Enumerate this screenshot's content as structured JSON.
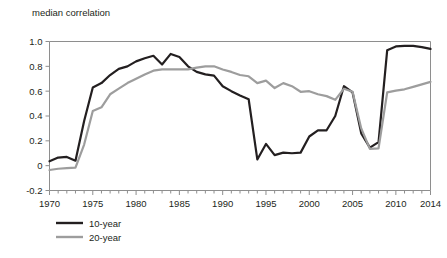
{
  "chart_data": {
    "type": "line",
    "title": "median correlation",
    "xlabel": "",
    "ylabel": "median correlation",
    "xlim": [
      1970,
      2014
    ],
    "ylim": [
      -0.2,
      1.0
    ],
    "grid": false,
    "legend_position": "bottom-left",
    "y_ticks": [
      "1.0",
      "0.8",
      "0.6",
      "0.4",
      "0.2",
      "0",
      "-0.2"
    ],
    "y_tick_values": [
      1.0,
      0.8,
      0.6,
      0.4,
      0.2,
      0,
      -0.2
    ],
    "x_ticks": [
      "1970",
      "1975",
      "1980",
      "1985",
      "1990",
      "1995",
      "2000",
      "2005",
      "2010",
      "2014"
    ],
    "x_tick_values": [
      1970,
      1975,
      1980,
      1985,
      1990,
      1995,
      2000,
      2005,
      2010,
      2014
    ],
    "x_minor_tick_step": 1,
    "x": [
      1970,
      1971,
      1972,
      1973,
      1974,
      1975,
      1976,
      1977,
      1978,
      1979,
      1980,
      1981,
      1982,
      1983,
      1984,
      1985,
      1986,
      1987,
      1988,
      1989,
      1990,
      1991,
      1992,
      1993,
      1994,
      1995,
      1996,
      1997,
      1998,
      1999,
      2000,
      2001,
      2002,
      2003,
      2004,
      2005,
      2006,
      2007,
      2008,
      2009,
      2010,
      2011,
      2012,
      2013,
      2014
    ],
    "series": [
      {
        "name": "10-year",
        "color": "#231f20",
        "width": 2.2,
        "values": [
          0.035,
          0.065,
          0.07,
          0.04,
          0.36,
          0.63,
          0.665,
          0.73,
          0.78,
          0.8,
          0.84,
          0.865,
          0.885,
          0.815,
          0.9,
          0.875,
          0.8,
          0.755,
          0.735,
          0.725,
          0.64,
          0.6,
          0.565,
          0.535,
          0.05,
          0.175,
          0.085,
          0.105,
          0.1,
          0.105,
          0.235,
          0.285,
          0.285,
          0.4,
          0.64,
          0.59,
          0.26,
          0.145,
          0.19,
          0.155,
          0.135,
          0.13,
          0.13,
          0.93,
          0.945
        ]
      },
      {
        "name": "20-year",
        "color": "#9d9d9d",
        "width": 2.2,
        "values": [
          -0.035,
          -0.025,
          -0.02,
          -0.015,
          0.17,
          0.44,
          0.47,
          0.575,
          0.62,
          0.665,
          0.7,
          0.735,
          0.765,
          0.775,
          0.775,
          0.775,
          0.775,
          0.79,
          0.8,
          0.8,
          0.775,
          0.755,
          0.73,
          0.72,
          0.665,
          0.685,
          0.625,
          0.665,
          0.64,
          0.595,
          0.6,
          0.575,
          0.56,
          0.53,
          0.62,
          0.595,
          0.3,
          0.135,
          0.14,
          0.135,
          0.125,
          0.12,
          0.125,
          0.59,
          0.605
        ]
      }
    ],
    "note_10yr_tail": [
      0.93,
      0.96,
      0.965,
      0.965,
      0.955,
      0.94
    ],
    "note_20yr_tail": [
      0.59,
      0.605,
      0.615,
      0.635,
      0.655,
      0.675
    ]
  },
  "legend": {
    "items": [
      {
        "label": "10-year",
        "color": "#231f20"
      },
      {
        "label": "20-year",
        "color": "#9d9d9d"
      }
    ]
  }
}
